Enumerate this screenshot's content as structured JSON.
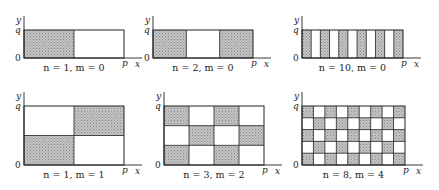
{
  "figure": {
    "axis_labels": {
      "x": "x",
      "y": "y",
      "x_end": "p",
      "y_end": "q",
      "origin": "0"
    },
    "colors": {
      "shade": "#b8b8b8",
      "stroke": "#222222",
      "background": "#ffffff"
    },
    "panels": [
      {
        "id": "p1",
        "caption": "n = 1, m = 0",
        "n": 1,
        "m": 0,
        "ox": 24,
        "oy": 58,
        "w": 100,
        "h": 28
      },
      {
        "id": "p2",
        "caption": "n = 2, m = 0",
        "n": 2,
        "m": 0,
        "ox": 153,
        "oy": 58,
        "w": 100,
        "h": 28
      },
      {
        "id": "p3",
        "caption": "n = 10, m = 0",
        "n": 10,
        "m": 0,
        "ox": 302,
        "oy": 58,
        "w": 101,
        "h": 28
      },
      {
        "id": "p4",
        "caption": "n = 1, m = 1",
        "n": 1,
        "m": 1,
        "ox": 24,
        "oy": 165,
        "w": 100,
        "h": 59
      },
      {
        "id": "p5",
        "caption": "n = 3, m = 2",
        "n": 3,
        "m": 2,
        "ox": 164,
        "oy": 165,
        "w": 100,
        "h": 59
      },
      {
        "id": "p6",
        "caption": "n = 8, m = 4",
        "n": 8,
        "m": 4,
        "ox": 302,
        "oy": 165,
        "w": 103,
        "h": 59
      }
    ]
  }
}
